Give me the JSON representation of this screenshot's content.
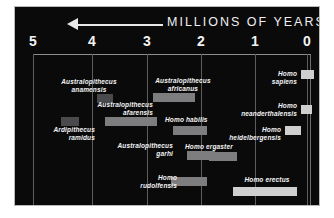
{
  "header": {
    "title": "MILLIONS OF YEARS AGO",
    "arrow_icon": "left-arrow-icon"
  },
  "chart_data": {
    "type": "bar",
    "orientation": "horizontal-ranges",
    "title": "MILLIONS OF YEARS AGO",
    "xlabel": "Millions of years ago",
    "ylabel": "",
    "xlim": [
      5,
      0
    ],
    "x_direction": "reversed",
    "grid": true,
    "gridlines": [
      5,
      4,
      3,
      2,
      1,
      0
    ],
    "legend": "none",
    "tick_labels": [
      "5",
      "4",
      "3",
      "2",
      "1",
      "0"
    ],
    "ranges": [
      {
        "name": "Australopithecus anamensis",
        "start": 4.2,
        "end": 3.8,
        "shade": "dim"
      },
      {
        "name": "Australopithecus africanus",
        "start": 3.0,
        "end": 2.3,
        "shade": "mid"
      },
      {
        "name": "Homo sapiens",
        "start": 0.2,
        "end": 0.0,
        "shade": "bright"
      },
      {
        "name": "Australopithecus afarensis",
        "start": 3.9,
        "end": 2.9,
        "shade": "mid"
      },
      {
        "name": "Homo neanderthalensis",
        "start": 0.25,
        "end": 0.03,
        "shade": "bright"
      },
      {
        "name": "Ardipithecus ramidus",
        "start": 4.5,
        "end": 4.2,
        "shade": "dim"
      },
      {
        "name": "Homo habilis",
        "start": 2.4,
        "end": 1.8,
        "shade": "mid"
      },
      {
        "name": "Homo heidelbergensis",
        "start": 0.6,
        "end": 0.3,
        "shade": "bright"
      },
      {
        "name": "Australopithecus garhi",
        "start": 2.1,
        "end": 1.6,
        "shade": "mid"
      },
      {
        "name": "Homo ergaster",
        "start": 1.9,
        "end": 1.4,
        "shade": "mid"
      },
      {
        "name": "Homo rudolfensis",
        "start": 2.4,
        "end": 1.8,
        "shade": "mid"
      },
      {
        "name": "Homo erectus",
        "start": 1.5,
        "end": 0.3,
        "shade": "bright"
      }
    ]
  },
  "axis": {
    "ticks": [
      {
        "label": "5",
        "x": 18
      },
      {
        "label": "4",
        "x": 77
      },
      {
        "label": "3",
        "x": 132
      },
      {
        "label": "2",
        "x": 186
      },
      {
        "label": "1",
        "x": 240
      },
      {
        "label": "0",
        "x": 292
      }
    ]
  },
  "taxa": [
    {
      "name": "Australopithecus anamensis",
      "line1": "Australopithecus",
      "line2": "anamensis",
      "label_x": 32,
      "label_y": 24,
      "label_w": 84,
      "align": "center",
      "bar_x": 82,
      "bar_y": 40,
      "bar_w": 16,
      "shade": "dim"
    },
    {
      "name": "Australopithecus africanus",
      "line1": "Australopithecus",
      "line2": "africanus",
      "label_x": 126,
      "label_y": 23,
      "label_w": 84,
      "align": "center",
      "bar_x": 138,
      "bar_y": 39,
      "bar_w": 42,
      "shade": "mid"
    },
    {
      "name": "Homo sapiens",
      "line1": "Homo",
      "line2": "sapiens",
      "label_x": 214,
      "label_y": 16,
      "label_w": 68,
      "align": "right",
      "bar_x": 286,
      "bar_y": 16,
      "bar_w": 13,
      "shade": "bright"
    },
    {
      "name": "Australopithecus afarensis",
      "line1": "Australopithecus",
      "line2": "afarensis",
      "label_x": 54,
      "label_y": 47,
      "label_w": 84,
      "align": "right",
      "bar_x": 90,
      "bar_y": 63,
      "bar_w": 52,
      "shade": "mid"
    },
    {
      "name": "Homo neanderthalensis",
      "line1": "Homo",
      "line2": "neanderthalensis",
      "label_x": 200,
      "label_y": 48,
      "label_w": 82,
      "align": "right",
      "bar_x": 286,
      "bar_y": 51,
      "bar_w": 11,
      "shade": "bright"
    },
    {
      "name": "Ardipithecus ramidus",
      "line1": "Ardipithecus",
      "line2": "ramidus",
      "label_x": 12,
      "label_y": 72,
      "label_w": 68,
      "align": "right",
      "bar_x": 46,
      "bar_y": 63,
      "bar_w": 18,
      "shade": "dim"
    },
    {
      "name": "Homo habilis",
      "line1": "Homo habilis",
      "line2": "",
      "label_x": 150,
      "label_y": 62,
      "label_w": 72,
      "align": "left",
      "bar_x": 158,
      "bar_y": 72,
      "bar_w": 34,
      "shade": "mid"
    },
    {
      "name": "Homo heidelbergensis",
      "line1": "Homo",
      "line2": "heidelbergensis",
      "label_x": 188,
      "label_y": 72,
      "label_w": 78,
      "align": "right",
      "bar_x": 270,
      "bar_y": 72,
      "bar_w": 16,
      "shade": "bright"
    },
    {
      "name": "Australopithecus garhi",
      "line1": "Australopithecus",
      "line2": "garhi",
      "label_x": 74,
      "label_y": 88,
      "label_w": 84,
      "align": "right",
      "bar_x": 172,
      "bar_y": 97,
      "bar_w": 28,
      "shade": "mid"
    },
    {
      "name": "Homo ergaster",
      "line1": "Homo ergaster",
      "line2": "",
      "label_x": 170,
      "label_y": 89,
      "label_w": 78,
      "align": "left",
      "bar_x": 194,
      "bar_y": 98,
      "bar_w": 28,
      "shade": "mid"
    },
    {
      "name": "Homo rudolfensis",
      "line1": "Homo",
      "line2": "rudolfensis",
      "label_x": 94,
      "label_y": 120,
      "label_w": 68,
      "align": "right",
      "bar_x": 156,
      "bar_y": 123,
      "bar_w": 36,
      "shade": "mid"
    },
    {
      "name": "Homo erectus",
      "line1": "Homo erectus",
      "line2": "",
      "label_x": 212,
      "label_y": 122,
      "label_w": 80,
      "align": "center",
      "bar_x": 218,
      "bar_y": 133,
      "bar_w": 64,
      "shade": "bright"
    }
  ]
}
